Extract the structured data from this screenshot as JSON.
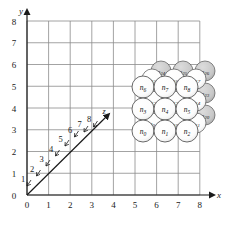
{
  "figure": {
    "type": "lattice-diagram",
    "background": "#ffffff",
    "grid_color": "#8c8c8c",
    "axis_color": "#1a1a1a",
    "sphere_front_fill": "#ffffff",
    "sphere_back_fill": "#c9c9c9",
    "sphere_stroke": "#555555"
  },
  "axes": {
    "x": {
      "label": "x",
      "ticks": [
        "0",
        "1",
        "2",
        "3",
        "4",
        "5",
        "6",
        "7",
        "8"
      ],
      "min": 0,
      "max": 8
    },
    "y": {
      "label": "y",
      "ticks": [
        "0",
        "1",
        "2",
        "3",
        "4",
        "5",
        "6",
        "7",
        "8"
      ],
      "min": 0,
      "max": 8
    },
    "z": {
      "label": "z",
      "ticks": [
        "1",
        "2",
        "3",
        "4",
        "5",
        "6",
        "7",
        "8"
      ],
      "min": 1,
      "max": 8,
      "direction": "diagonal-up-right"
    }
  },
  "origin_label": "0",
  "spheres": {
    "layer_front": [
      {
        "id": "n0",
        "label": "n",
        "sub": "0",
        "cx": 143,
        "cy": 131,
        "r": 11,
        "shaded": false
      },
      {
        "id": "n1",
        "label": "n",
        "sub": "1",
        "cx": 165,
        "cy": 131,
        "r": 11,
        "shaded": false
      },
      {
        "id": "n2",
        "label": "n",
        "sub": "2",
        "cx": 187,
        "cy": 131,
        "r": 11,
        "shaded": false
      },
      {
        "id": "n3",
        "label": "n",
        "sub": "3",
        "cx": 143,
        "cy": 109,
        "r": 11,
        "shaded": false
      },
      {
        "id": "n4",
        "label": "n",
        "sub": "4",
        "cx": 165,
        "cy": 109,
        "r": 11,
        "shaded": false
      },
      {
        "id": "n5",
        "label": "n",
        "sub": "5",
        "cx": 187,
        "cy": 109,
        "r": 11,
        "shaded": false
      },
      {
        "id": "n6",
        "label": "n",
        "sub": "6",
        "cx": 143,
        "cy": 87,
        "r": 11,
        "shaded": false
      },
      {
        "id": "n7",
        "label": "n",
        "sub": "7",
        "cx": 165,
        "cy": 87,
        "r": 11,
        "shaded": false
      },
      {
        "id": "n8",
        "label": "n",
        "sub": "8",
        "cx": 187,
        "cy": 87,
        "r": 11,
        "shaded": false
      }
    ],
    "layer_middle": [
      {
        "id": "n9",
        "label": "n",
        "sub": "9",
        "cx": 152,
        "cy": 123,
        "r": 10,
        "shaded": false
      },
      {
        "id": "n10",
        "label": "n",
        "sub": "10",
        "cx": 174,
        "cy": 123,
        "r": 10,
        "shaded": false
      },
      {
        "id": "n11",
        "label": "n",
        "sub": "11",
        "cx": 196,
        "cy": 123,
        "r": 10,
        "shaded": false
      },
      {
        "id": "n12",
        "label": "n",
        "sub": "12",
        "cx": 152,
        "cy": 101,
        "r": 10,
        "shaded": false
      },
      {
        "id": "n13",
        "label": "n",
        "sub": "13",
        "cx": 174,
        "cy": 101,
        "r": 10,
        "shaded": false
      },
      {
        "id": "n14",
        "label": "n",
        "sub": "14",
        "cx": 196,
        "cy": 101,
        "r": 10,
        "shaded": false
      },
      {
        "id": "n15",
        "label": "n",
        "sub": "15",
        "cx": 152,
        "cy": 79,
        "r": 10,
        "shaded": false
      },
      {
        "id": "n16",
        "label": "n",
        "sub": "16",
        "cx": 174,
        "cy": 79,
        "r": 10,
        "shaded": false
      },
      {
        "id": "n17",
        "label": "n",
        "sub": "17",
        "cx": 196,
        "cy": 79,
        "r": 10,
        "shaded": false
      }
    ],
    "layer_back": [
      {
        "id": "n18",
        "label": "n",
        "sub": "18",
        "cx": 161,
        "cy": 115,
        "r": 10,
        "shaded": true,
        "hidden": true
      },
      {
        "id": "n19",
        "label": "n",
        "sub": "19",
        "cx": 183,
        "cy": 115,
        "r": 10,
        "shaded": true,
        "hidden": true
      },
      {
        "id": "n20",
        "label": "n",
        "sub": "20",
        "cx": 205,
        "cy": 115,
        "r": 10,
        "shaded": true,
        "hidden": false
      },
      {
        "id": "n21",
        "label": "n",
        "sub": "21",
        "cx": 161,
        "cy": 93,
        "r": 10,
        "shaded": true,
        "hidden": true
      },
      {
        "id": "n22",
        "label": "n",
        "sub": "22",
        "cx": 183,
        "cy": 93,
        "r": 10,
        "shaded": true,
        "hidden": true
      },
      {
        "id": "n23",
        "label": "n",
        "sub": "23",
        "cx": 205,
        "cy": 93,
        "r": 10,
        "shaded": true,
        "hidden": false
      },
      {
        "id": "n24",
        "label": "n",
        "sub": "24",
        "cx": 161,
        "cy": 71,
        "r": 10,
        "shaded": true,
        "hidden": false
      },
      {
        "id": "n25",
        "label": "n",
        "sub": "25",
        "cx": 183,
        "cy": 71,
        "r": 10,
        "shaded": true,
        "hidden": false
      },
      {
        "id": "n26",
        "label": "n",
        "sub": "26",
        "cx": 205,
        "cy": 71,
        "r": 10,
        "shaded": true,
        "hidden": false
      }
    ]
  }
}
